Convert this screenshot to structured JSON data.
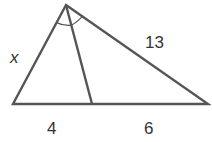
{
  "diagram": {
    "type": "triangle-angle-bisector",
    "stroke_color": "#555555",
    "vertices": {
      "apex": [
        66,
        5
      ],
      "bottom_left": [
        13,
        104
      ],
      "foot": [
        92,
        104
      ],
      "bottom_right": [
        208,
        104
      ]
    },
    "labels": {
      "left_side": "x",
      "right_side": "13",
      "base_left_segment": "4",
      "base_right_segment": "6"
    },
    "angle_marks": 2
  }
}
